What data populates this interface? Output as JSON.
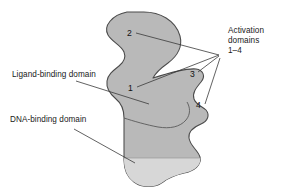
{
  "figure": {
    "background_color": "#ffffff",
    "body_fill": "#b9b9b9",
    "lower_fill": "#d5d5d5",
    "outline_color": "#4a4a4a",
    "leader_color": "#3a3a3a",
    "text_color": "#1a1a1a"
  },
  "labels": {
    "activation": "Activation\ndomains\n1–4",
    "ligand": "Ligand-binding domain",
    "dna": "DNA-binding domain"
  },
  "callouts": [
    {
      "id": "1",
      "label": "1"
    },
    {
      "id": "2",
      "label": "2"
    },
    {
      "id": "3",
      "label": "3"
    },
    {
      "id": "4",
      "label": "4"
    }
  ]
}
